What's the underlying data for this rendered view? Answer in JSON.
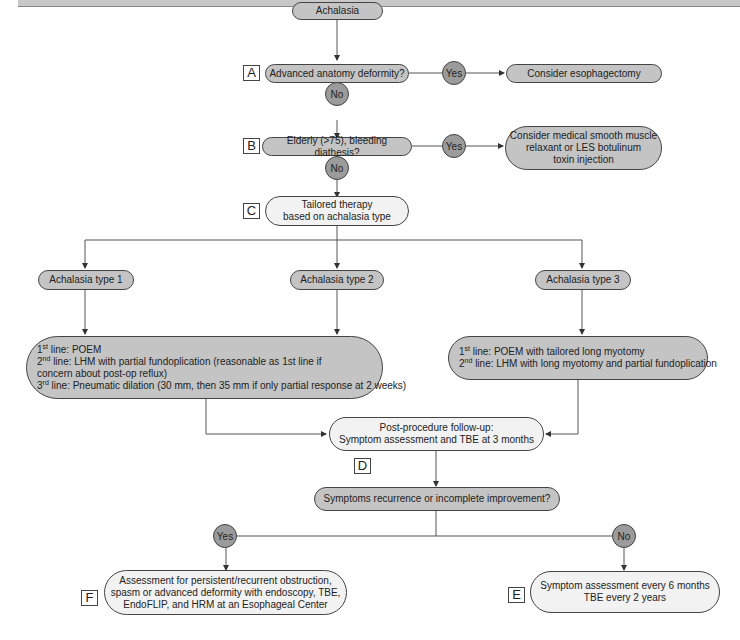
{
  "nodes": {
    "start": "Achalasia",
    "a_question": "Advanced anatomy deformity?",
    "a_yes": "Consider esophagectomy",
    "b_question": "Elderly (>75), bleeding diathesis?",
    "b_yes": [
      "Consider medical smooth muscle",
      "relaxant or LES botulinum",
      "toxin injection"
    ],
    "c_tailored": [
      "Tailored therapy",
      "based on achalasia type"
    ],
    "type1": "Achalasia type 1",
    "type2": "Achalasia type 2",
    "type3": "Achalasia type 3",
    "type12_therapy": {
      "line1_ord": "st",
      "line1": " line: POEM",
      "line2_ord": "nd",
      "line2": " line: LHM with partial fundoplication (reasonable as 1st line if",
      "line2b": "concern about post-op reflux)",
      "line3_ord": "rd",
      "line3": " line: Pneumatic dilation (30 mm, then 35 mm if only partial response at 2 weeks)"
    },
    "type3_therapy": {
      "line1_ord": "st",
      "line1": " line: POEM with tailored long myotomy",
      "line2_ord": "nd",
      "line2": " line: LHM with long myotomy and partial fundoplication"
    },
    "d_followup": [
      "Post-procedure follow-up:",
      "Symptom assessment and TBE at 3 months"
    ],
    "recurrence_question": "Symptoms recurrence or incomplete improvement?",
    "f_assessment": [
      "Assessment for persistent/recurrent obstruction,",
      "spasm or advanced deformity with endoscopy, TBE,",
      "EndoFLIP, and HRM at an Esophageal Center"
    ],
    "e_surveillance": [
      "Symptom assessment every 6 months",
      "TBE every 2 years"
    ]
  },
  "decisions": {
    "yes": "Yes",
    "no": "No"
  },
  "step_labels": {
    "a": "A",
    "b": "B",
    "c": "C",
    "d": "D",
    "e": "E",
    "f": "F"
  },
  "ordinal_numbers": {
    "first": "1",
    "second": "2",
    "third": "3"
  },
  "colors": {
    "decision_fill": "#c4c4c4",
    "outcome_fill": "#f2f2f2",
    "circle_fill": "#9b9b9b",
    "line": "#444444"
  }
}
